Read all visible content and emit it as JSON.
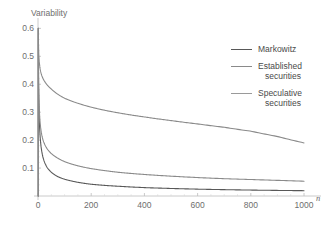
{
  "chart_data": {
    "type": "line",
    "title": "",
    "xlabel": "n",
    "ylabel": "Variability",
    "xlim": [
      0,
      1030
    ],
    "ylim": [
      0,
      0.63
    ],
    "grid": false,
    "legend_position": "right",
    "x_ticks": [
      "0",
      "200",
      "400",
      "600",
      "800",
      "1000"
    ],
    "x_tick_values": [
      0,
      200,
      400,
      600,
      800,
      1000
    ],
    "y_ticks": [
      "0.1",
      "0.2",
      "0.3",
      "0.4",
      "0.5",
      "0.6"
    ],
    "y_tick_values": [
      0.1,
      0.2,
      0.3,
      0.4,
      0.5,
      0.6
    ],
    "series": [
      {
        "name": "Markowitz",
        "color": "#585858",
        "x": [
          1,
          2,
          3,
          5,
          8,
          12,
          18,
          25,
          35,
          50,
          75,
          100,
          150,
          200,
          250,
          300,
          400,
          500,
          600,
          700,
          800,
          900,
          1000
        ],
        "values": [
          0.6,
          0.424,
          0.346,
          0.268,
          0.212,
          0.173,
          0.141,
          0.12,
          0.101,
          0.085,
          0.069,
          0.06,
          0.049,
          0.042,
          0.038,
          0.035,
          0.03,
          0.027,
          0.0245,
          0.0227,
          0.0212,
          0.02,
          0.019
        ]
      },
      {
        "name": "Established securities",
        "color": "#8a8a8a",
        "x": [
          1,
          2,
          3,
          5,
          8,
          12,
          18,
          25,
          35,
          50,
          75,
          100,
          150,
          200,
          250,
          300,
          400,
          500,
          600,
          700,
          800,
          900,
          1000
        ],
        "values": [
          0.6,
          0.44,
          0.372,
          0.308,
          0.262,
          0.23,
          0.203,
          0.185,
          0.168,
          0.152,
          0.135,
          0.123,
          0.108,
          0.098,
          0.091,
          0.085,
          0.077,
          0.071,
          0.066,
          0.062,
          0.059,
          0.056,
          0.053
        ]
      },
      {
        "name": "Speculative securities",
        "color": "#8a8a8a",
        "x": [
          1,
          2,
          3,
          5,
          8,
          12,
          18,
          25,
          35,
          50,
          75,
          100,
          150,
          200,
          250,
          300,
          400,
          500,
          600,
          700,
          800,
          900,
          1000
        ],
        "values": [
          0.6,
          0.538,
          0.508,
          0.478,
          0.455,
          0.438,
          0.422,
          0.41,
          0.397,
          0.383,
          0.364,
          0.35,
          0.332,
          0.318,
          0.307,
          0.298,
          0.283,
          0.27,
          0.258,
          0.246,
          0.232,
          0.213,
          0.19
        ]
      }
    ],
    "legend": [
      {
        "label": "Markowitz",
        "line2": "",
        "color": "#585858"
      },
      {
        "label": "Established",
        "line2": "securities",
        "color": "#8a8a8a"
      },
      {
        "label": "Speculative",
        "line2": "securities",
        "color": "#9a9a9a"
      }
    ],
    "axis_color": "#bdbdbd"
  }
}
